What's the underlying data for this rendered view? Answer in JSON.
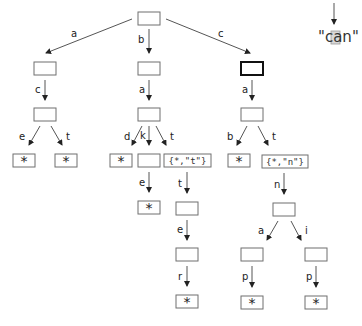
{
  "diagram": {
    "type": "trie",
    "highlight_word": {
      "open_quote": "\"",
      "char_c": "c",
      "char_a": "a",
      "char_n": "n",
      "close_quote": "\"",
      "highlighted_char_index": 1
    },
    "edge_labels": {
      "root_a": "a",
      "root_b": "b",
      "root_c": "c",
      "a_c": "c",
      "ac_e": "e",
      "ac_t": "t",
      "b_a": "a",
      "ba_d": "d",
      "ba_k": "k",
      "ba_t": "t",
      "bak_e": "e",
      "bat_t": "t",
      "batt_e": "e",
      "batte_r": "r",
      "c_a": "a",
      "ca_b": "b",
      "ca_t": "t",
      "cat_n": "n",
      "catn_a": "a",
      "catn_i": "i",
      "catna_p": "p",
      "catni_p": "p"
    },
    "node_labels": {
      "end": "*",
      "bat": "{*,\"t\"}",
      "cat": "{*,\"n\"}"
    },
    "current_node": "c"
  }
}
